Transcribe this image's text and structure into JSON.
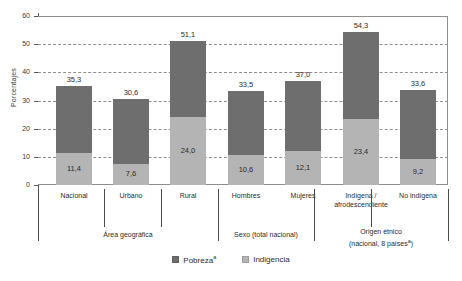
{
  "chart_data": {
    "type": "bar",
    "stacked": true,
    "title": "",
    "xlabel": "",
    "ylabel": "Porcentajes",
    "ylim": [
      0,
      60
    ],
    "yticks": [
      0,
      10,
      20,
      30,
      40,
      50,
      60
    ],
    "grid": true,
    "legend_position": "bottom-center",
    "categories": [
      "Nacional",
      "Urbano",
      "Rural",
      "Hombres",
      "Mujeres",
      "Indígena / afrodescendiente",
      "No indígena"
    ],
    "series": [
      {
        "name": "Pobreza",
        "color": "#6e6e6e",
        "note": "total value shown above each bar (includes indigencia)",
        "values": [
          35.3,
          30.6,
          51.1,
          33.5,
          37.0,
          54.3,
          33.6
        ]
      },
      {
        "name": "Indigencia",
        "color": "#b4b4b4",
        "values": [
          11.4,
          7.6,
          24.0,
          10.6,
          12.1,
          23.4,
          9.2
        ]
      }
    ],
    "total_labels": [
      "35,3",
      "30,6",
      "51,1",
      "33,5",
      "37,0",
      "54,3",
      "33,6"
    ],
    "indigencia_labels": [
      "11,4",
      "7,6",
      "24,0",
      "10,6",
      "12,1",
      "23,4",
      "9,2"
    ],
    "groups": [
      {
        "label": "Área geográfica",
        "label_line2": "",
        "members": [
          0,
          1,
          2
        ]
      },
      {
        "label": "Sexo (total nacional)",
        "label_line2": "",
        "members": [
          3,
          4
        ]
      },
      {
        "label": "Origen étnico",
        "label_line2": "(nacional, 8 países",
        "label_line2_sup": "a",
        "label_line2_end": ")",
        "members": [
          5,
          6
        ]
      }
    ]
  },
  "axis": {
    "y_title": "Porcentajes",
    "y_tick_labels": [
      "60",
      "50",
      "40",
      "30",
      "20",
      "10",
      "0"
    ]
  },
  "category_labels": [
    {
      "line1": "Nacional",
      "line2": ""
    },
    {
      "line1": "Urbano",
      "line2": ""
    },
    {
      "line1": "Rural",
      "line2": ""
    },
    {
      "line1": "Hombres",
      "line2": ""
    },
    {
      "line1": "Mujeres",
      "line2": ""
    },
    {
      "line1": "Indígena /",
      "line2": "afrodescendiente"
    },
    {
      "line1": "No indígena",
      "line2": ""
    }
  ],
  "group_labels": [
    {
      "line1": "Área geográfica",
      "line2": ""
    },
    {
      "line1": "Sexo (total nacional)",
      "line2": ""
    },
    {
      "line1": "Origen étnico",
      "line2": "(nacional, 8 países",
      "sup": "a",
      "line2_end": ")"
    }
  ],
  "legend": {
    "items": [
      {
        "label": "Pobreza",
        "sup": "a",
        "color": "#6e6e6e"
      },
      {
        "label": "Indigencia",
        "sup": "",
        "color": "#b4b4b4"
      }
    ]
  },
  "bar_values": {
    "totals": [
      "35,3",
      "30,6",
      "51,1",
      "33,5",
      "37,0",
      "54,3",
      "33,6"
    ],
    "indigencia": [
      "11,4",
      "7,6",
      "24,0",
      "10,6",
      "12,1",
      "23,4",
      "9,2"
    ]
  }
}
